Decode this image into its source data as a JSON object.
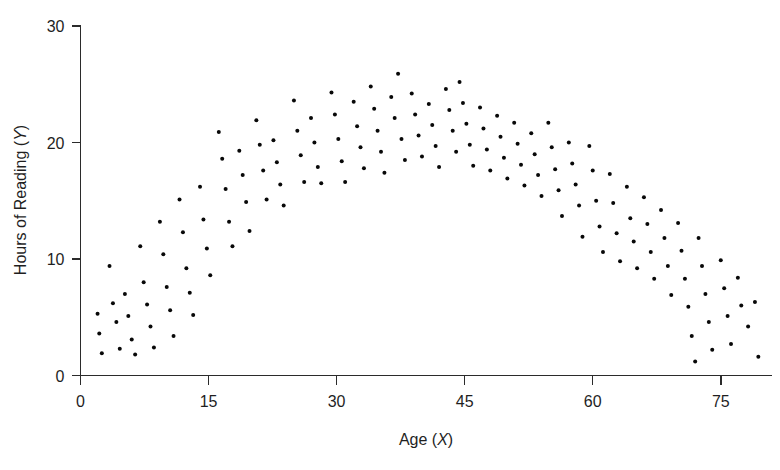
{
  "figure": {
    "background_color": "#ffffff",
    "point_color": "#080808",
    "axis_color": "#2b2b2b"
  },
  "axes": {
    "x_title_main": "Age (",
    "x_title_var": "X",
    "x_title_close": ")",
    "y_title_main": "Hours of Reading (",
    "y_title_var": "Y",
    "y_title_close": ")",
    "x_tick_labels": [
      "0",
      "15",
      "30",
      "45",
      "60",
      "75"
    ],
    "y_tick_labels": [
      "0",
      "10",
      "20",
      "30"
    ]
  },
  "chart_data": {
    "type": "scatter",
    "title": "",
    "xlabel": "Age (X)",
    "ylabel": "Hours of Reading (Y)",
    "xlim": [
      0,
      81
    ],
    "ylim": [
      0,
      30
    ],
    "xticks": [
      0,
      15,
      30,
      45,
      60,
      75
    ],
    "yticks": [
      0,
      10,
      20,
      30
    ],
    "grid": false,
    "legend": false,
    "relationship": "curvilinear inverted-U",
    "marker": "filled circle",
    "marker_size_px": 4,
    "n_points": 148,
    "points": [
      [
        2.0,
        5.3
      ],
      [
        2.2,
        3.6
      ],
      [
        2.5,
        1.9
      ],
      [
        3.4,
        9.4
      ],
      [
        3.8,
        6.2
      ],
      [
        4.2,
        4.6
      ],
      [
        4.6,
        2.3
      ],
      [
        5.2,
        7.0
      ],
      [
        5.6,
        5.1
      ],
      [
        6.0,
        3.1
      ],
      [
        6.4,
        1.8
      ],
      [
        7.0,
        11.1
      ],
      [
        7.4,
        8.0
      ],
      [
        7.8,
        6.1
      ],
      [
        8.2,
        4.2
      ],
      [
        8.6,
        2.4
      ],
      [
        9.3,
        13.2
      ],
      [
        9.7,
        10.4
      ],
      [
        10.1,
        7.6
      ],
      [
        10.5,
        5.6
      ],
      [
        10.9,
        3.4
      ],
      [
        11.6,
        15.1
      ],
      [
        12.0,
        12.3
      ],
      [
        12.4,
        9.2
      ],
      [
        12.8,
        7.1
      ],
      [
        13.2,
        5.2
      ],
      [
        14.0,
        16.2
      ],
      [
        14.4,
        13.4
      ],
      [
        14.8,
        10.9
      ],
      [
        15.2,
        8.6
      ],
      [
        16.2,
        20.9
      ],
      [
        16.6,
        18.6
      ],
      [
        17.0,
        16.0
      ],
      [
        17.4,
        13.2
      ],
      [
        17.8,
        11.1
      ],
      [
        18.6,
        19.3
      ],
      [
        19.0,
        17.2
      ],
      [
        19.4,
        14.9
      ],
      [
        19.8,
        12.4
      ],
      [
        20.6,
        21.9
      ],
      [
        21.0,
        19.8
      ],
      [
        21.4,
        17.6
      ],
      [
        21.8,
        15.1
      ],
      [
        22.6,
        20.2
      ],
      [
        23.0,
        18.3
      ],
      [
        23.4,
        16.4
      ],
      [
        23.8,
        14.6
      ],
      [
        25.0,
        23.6
      ],
      [
        25.4,
        21.0
      ],
      [
        25.8,
        18.9
      ],
      [
        26.2,
        16.6
      ],
      [
        27.0,
        22.1
      ],
      [
        27.4,
        20.0
      ],
      [
        27.8,
        17.9
      ],
      [
        28.2,
        16.5
      ],
      [
        29.4,
        24.3
      ],
      [
        29.8,
        22.4
      ],
      [
        30.2,
        20.3
      ],
      [
        30.6,
        18.4
      ],
      [
        31.0,
        16.6
      ],
      [
        32.0,
        23.5
      ],
      [
        32.4,
        21.4
      ],
      [
        32.8,
        19.6
      ],
      [
        33.2,
        17.8
      ],
      [
        34.0,
        24.8
      ],
      [
        34.4,
        22.9
      ],
      [
        34.8,
        21.0
      ],
      [
        35.2,
        19.2
      ],
      [
        35.6,
        17.4
      ],
      [
        36.4,
        23.9
      ],
      [
        36.8,
        22.1
      ],
      [
        37.2,
        25.9
      ],
      [
        37.6,
        20.3
      ],
      [
        38.0,
        18.5
      ],
      [
        38.8,
        24.2
      ],
      [
        39.2,
        22.4
      ],
      [
        39.6,
        20.6
      ],
      [
        40.0,
        18.8
      ],
      [
        40.8,
        23.3
      ],
      [
        41.2,
        21.5
      ],
      [
        41.6,
        19.7
      ],
      [
        42.0,
        17.9
      ],
      [
        42.8,
        24.6
      ],
      [
        43.2,
        22.8
      ],
      [
        43.6,
        21.0
      ],
      [
        44.0,
        19.2
      ],
      [
        44.4,
        25.2
      ],
      [
        44.8,
        23.4
      ],
      [
        45.2,
        21.6
      ],
      [
        45.6,
        19.8
      ],
      [
        46.0,
        18.0
      ],
      [
        46.8,
        23.0
      ],
      [
        47.2,
        21.2
      ],
      [
        47.6,
        19.4
      ],
      [
        48.0,
        17.6
      ],
      [
        48.8,
        22.3
      ],
      [
        49.2,
        20.5
      ],
      [
        49.6,
        18.7
      ],
      [
        50.0,
        16.9
      ],
      [
        50.8,
        21.7
      ],
      [
        51.2,
        19.9
      ],
      [
        51.6,
        18.1
      ],
      [
        52.0,
        16.3
      ],
      [
        52.8,
        20.8
      ],
      [
        53.2,
        19.0
      ],
      [
        53.6,
        17.2
      ],
      [
        54.0,
        15.4
      ],
      [
        54.8,
        21.7
      ],
      [
        55.2,
        19.6
      ],
      [
        55.6,
        17.7
      ],
      [
        56.0,
        15.9
      ],
      [
        56.4,
        13.7
      ],
      [
        57.2,
        20.0
      ],
      [
        57.6,
        18.2
      ],
      [
        58.0,
        16.4
      ],
      [
        58.4,
        14.6
      ],
      [
        58.8,
        11.9
      ],
      [
        59.6,
        19.7
      ],
      [
        60.0,
        17.6
      ],
      [
        60.4,
        15.0
      ],
      [
        60.8,
        12.8
      ],
      [
        61.2,
        10.6
      ],
      [
        62.0,
        17.3
      ],
      [
        62.4,
        14.8
      ],
      [
        62.8,
        12.2
      ],
      [
        63.2,
        9.8
      ],
      [
        64.0,
        16.2
      ],
      [
        64.4,
        13.5
      ],
      [
        64.8,
        11.5
      ],
      [
        65.2,
        9.2
      ],
      [
        66.0,
        15.3
      ],
      [
        66.4,
        13.0
      ],
      [
        66.8,
        10.6
      ],
      [
        67.2,
        8.3
      ],
      [
        68.0,
        14.2
      ],
      [
        68.4,
        11.8
      ],
      [
        68.8,
        9.4
      ],
      [
        69.2,
        6.9
      ],
      [
        70.0,
        13.1
      ],
      [
        70.4,
        10.7
      ],
      [
        70.8,
        8.3
      ],
      [
        71.2,
        5.9
      ],
      [
        71.6,
        3.4
      ],
      [
        72.4,
        11.8
      ],
      [
        72.8,
        9.4
      ],
      [
        73.2,
        7.0
      ],
      [
        73.6,
        4.6
      ],
      [
        74.0,
        2.2
      ],
      [
        75.0,
        9.9
      ],
      [
        75.4,
        7.5
      ],
      [
        75.8,
        5.1
      ],
      [
        76.2,
        2.7
      ],
      [
        77.0,
        8.4
      ],
      [
        77.4,
        6.0
      ],
      [
        78.2,
        4.2
      ],
      [
        79.0,
        6.3
      ],
      [
        79.4,
        1.6
      ],
      [
        72.0,
        1.2
      ]
    ]
  }
}
